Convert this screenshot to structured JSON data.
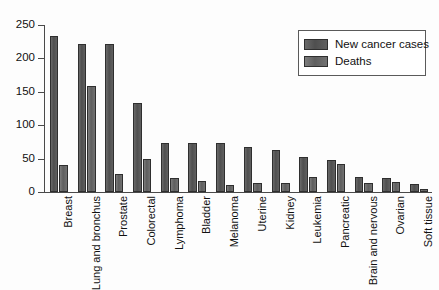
{
  "chart_data": {
    "type": "bar",
    "title": "",
    "xlabel": "",
    "ylabel": "",
    "ylim": [
      0,
      250
    ],
    "yticks": [
      0,
      50,
      100,
      150,
      200,
      250
    ],
    "grid": false,
    "legend_position": "top-right",
    "categories": [
      "Breast",
      "Lung and bronchus",
      "Prostate",
      "Colorectal",
      "Lymphoma",
      "Bladder",
      "Melanoma",
      "Uterine",
      "Kidney",
      "Leukemia",
      "Pancreatic",
      "Brain and nervous",
      "Ovarian",
      "Soft tissue"
    ],
    "series": [
      {
        "name": "New cancer cases",
        "color": "#595959",
        "values": [
          234,
          221,
          221,
          133,
          74,
          73,
          73,
          68,
          63,
          53,
          48,
          22,
          21,
          12
        ]
      },
      {
        "name": "Deaths",
        "color": "#6b6b6b",
        "values": [
          41,
          158,
          27,
          50,
          21,
          16,
          10,
          13,
          14,
          23,
          42,
          14,
          15,
          5
        ]
      }
    ]
  },
  "legend": {
    "entries": [
      {
        "label": "New cancer cases"
      },
      {
        "label": "Deaths"
      }
    ]
  }
}
